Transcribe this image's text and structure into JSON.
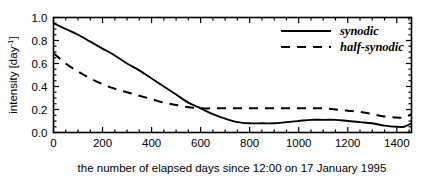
{
  "chart_data": {
    "type": "line",
    "title": "",
    "xlabel": "the number of elapsed days since 12:00 on 17 January 1995",
    "ylabel": "intensity [day-1]",
    "ylabel_base": "intensity [day",
    "ylabel_sup": "-1",
    "ylabel_tail": "]",
    "xlim": [
      0,
      1460
    ],
    "ylim": [
      0,
      1.0
    ],
    "grid": false,
    "legend_position": "top-right",
    "xticks": [
      0,
      200,
      400,
      600,
      800,
      1000,
      1200,
      1400
    ],
    "xtick_labels": [
      "0",
      "200",
      "400",
      "600",
      "800",
      "1000",
      "1200",
      "1400"
    ],
    "x_minor_tick_step": 50,
    "yticks": [
      0.0,
      0.2,
      0.4,
      0.6,
      0.8,
      1.0
    ],
    "ytick_labels": [
      "0.0",
      "0.2",
      "0.4",
      "0.6",
      "0.8",
      "1.0"
    ],
    "y_minor_tick_step": 0.05,
    "x": [
      0,
      50,
      100,
      150,
      200,
      250,
      300,
      350,
      400,
      450,
      500,
      550,
      600,
      650,
      700,
      750,
      800,
      850,
      900,
      950,
      1000,
      1050,
      1100,
      1150,
      1200,
      1250,
      1300,
      1350,
      1400,
      1430,
      1460
    ],
    "series": [
      {
        "name": "synodic",
        "style": "solid",
        "color": "#000000",
        "values": [
          0.95,
          0.9,
          0.85,
          0.79,
          0.73,
          0.67,
          0.6,
          0.54,
          0.47,
          0.4,
          0.33,
          0.26,
          0.21,
          0.16,
          0.12,
          0.09,
          0.08,
          0.08,
          0.08,
          0.09,
          0.1,
          0.11,
          0.11,
          0.11,
          0.1,
          0.09,
          0.08,
          0.06,
          0.05,
          0.05,
          0.08
        ]
      },
      {
        "name": "half-synodic",
        "style": "dashed",
        "color": "#000000",
        "values": [
          0.69,
          0.6,
          0.53,
          0.47,
          0.42,
          0.38,
          0.35,
          0.32,
          0.29,
          0.26,
          0.24,
          0.22,
          0.21,
          0.21,
          0.21,
          0.21,
          0.21,
          0.21,
          0.21,
          0.21,
          0.21,
          0.21,
          0.21,
          0.2,
          0.19,
          0.18,
          0.16,
          0.14,
          0.13,
          0.13,
          0.16
        ]
      }
    ],
    "legend": [
      {
        "label": "synodic",
        "style": "solid"
      },
      {
        "label": "half-synodic",
        "style": "dashed"
      }
    ]
  }
}
